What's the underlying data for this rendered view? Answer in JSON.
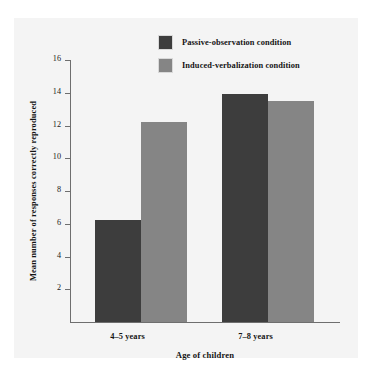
{
  "chart_data": {
    "type": "bar",
    "title": "",
    "xlabel": "Age of children",
    "ylabel": "Mean number of responses correctly reproduced",
    "categories": [
      "4–5 years",
      "7–8 years"
    ],
    "series": [
      {
        "name": "Passive-observation condition",
        "color": "#3d3d3d",
        "values": [
          6.2,
          13.9
        ]
      },
      {
        "name": "Induced-verbalization condition",
        "color": "#858585",
        "values": [
          12.2,
          13.5
        ]
      }
    ],
    "ylim": [
      0,
      16
    ],
    "yticks": [
      0,
      2,
      4,
      6,
      8,
      10,
      12,
      14,
      16
    ],
    "ytick_labels": [
      "",
      "2",
      "4",
      "6",
      "8",
      "10",
      "12",
      "14",
      "16"
    ],
    "grid": false,
    "legend_position": "top-center",
    "axis_color": "#6e6e6e",
    "background_color": "#f4f4f4"
  },
  "legend": {
    "items": [
      {
        "label": "Passive-observation condition",
        "swatch": "legend-swatch-dark"
      },
      {
        "label": "Induced-verbalization condition",
        "swatch": "legend-swatch-grey"
      }
    ]
  }
}
